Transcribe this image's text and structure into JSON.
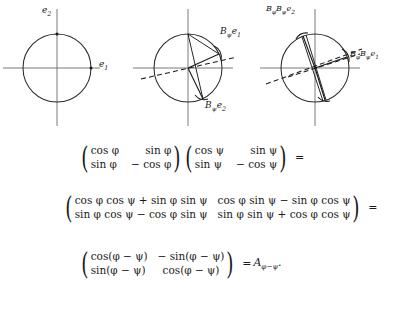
{
  "figures": [
    {
      "id": "unit-circle-basis",
      "labels": [
        {
          "name": "e2-label",
          "text": "e",
          "sub": "2",
          "x": 42,
          "y": 7
        },
        {
          "name": "e1-label",
          "text": "e",
          "sub": "1",
          "x": 99,
          "y": 61
        }
      ]
    },
    {
      "id": "reflection-psi",
      "labels": [
        {
          "name": "b-psi-e1-label",
          "prefix": "B",
          "prefix_sub": "ψ",
          "text": "e",
          "sub": "1",
          "x": 220,
          "y": 32
        },
        {
          "name": "b-psi-e2-label",
          "prefix": "B",
          "prefix_sub": "ψ",
          "text": "e",
          "sub": "2",
          "x": 205,
          "y": 106
        }
      ]
    },
    {
      "id": "composition-phi-psi",
      "labels": [
        {
          "name": "b-phi-b-psi-e2-label",
          "prefix1": "B",
          "prefix1_sub": "φ",
          "prefix2": "B",
          "prefix2_sub": "ψ",
          "text": "e",
          "sub": "2",
          "x": 266,
          "y": 6
        },
        {
          "name": "b-phi-b-psi-e1-label",
          "prefix1": "B",
          "prefix1_sub": "φ",
          "prefix2": "B",
          "prefix2_sub": "ψ",
          "text": "e",
          "sub": "1",
          "x": 350,
          "y": 51
        }
      ]
    }
  ],
  "equations": {
    "line1": {
      "matrix_a": {
        "r1c1": "cos φ",
        "r1c2": "sin φ",
        "r2c1": "sin φ",
        "r2c2": "− cos φ"
      },
      "matrix_b": {
        "r1c1": "cos ψ",
        "r1c2": "sin ψ",
        "r2c1": "sin ψ",
        "r2c2": "− cos ψ"
      },
      "equals": "="
    },
    "line2": {
      "matrix": {
        "r1c1": "cos φ cos ψ + sin φ sin ψ",
        "r1c2": "cos φ sin ψ − sin φ cos ψ",
        "r2c1": "sin φ cos ψ − cos φ sin ψ",
        "r2c2": "sin φ sin ψ + cos φ cos ψ"
      },
      "equals": "="
    },
    "line3": {
      "matrix": {
        "r1c1": "cos(φ − ψ)",
        "r1c2": "− sin(φ − ψ)",
        "r2c1": "sin(φ − ψ)",
        "r2c2": "cos(φ − ψ)"
      },
      "equals": "=",
      "result": "A",
      "result_sub": "φ−ψ",
      "period": "."
    }
  }
}
